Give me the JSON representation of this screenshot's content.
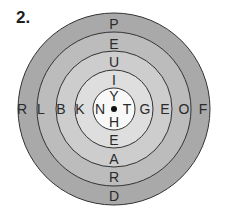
{
  "title": "2.",
  "diagram": {
    "type": "concentric-letter-target",
    "center": {
      "dot": true
    },
    "rings": [
      {
        "name": "outer",
        "color": "#a9a9a9"
      },
      {
        "name": "ring-4",
        "color": "#bdbdbd"
      },
      {
        "name": "ring-3",
        "color": "#cfcfcf"
      },
      {
        "name": "ring-2",
        "color": "#e0e0e0"
      },
      {
        "name": "center",
        "color": "#f7f7f7"
      }
    ],
    "horizontal_letters": [
      "R",
      "L",
      "B",
      "K",
      "N",
      "T",
      "G",
      "E",
      "O",
      "F"
    ],
    "vertical_letters": [
      "P",
      "E",
      "U",
      "I",
      "Y",
      "H",
      "E",
      "A",
      "R",
      "D"
    ],
    "letters": {
      "left": [
        "R",
        "L",
        "B",
        "K",
        "N"
      ],
      "right": [
        "T",
        "G",
        "E",
        "O",
        "F"
      ],
      "top": [
        "P",
        "E",
        "U",
        "I",
        "Y"
      ],
      "bottom": [
        "H",
        "E",
        "A",
        "R",
        "D"
      ]
    }
  }
}
